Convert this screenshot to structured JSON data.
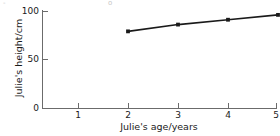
{
  "figure": {
    "background_color": "#ffffff",
    "axis_color": "#6b6b6b",
    "text_color": "#1a1a1a",
    "series_color": "#1a1a1a",
    "top_edge_artifacts": [
      "-",
      "o"
    ]
  },
  "chart_data": {
    "type": "line",
    "title": "",
    "subtitle": "",
    "xlabel": "Julie's age/years",
    "ylabel": "Julie's height/cm",
    "x": [
      2,
      3,
      4,
      5
    ],
    "values": [
      79,
      86,
      91,
      96
    ],
    "series": [
      {
        "name": "Julie's height",
        "x": [
          2,
          3,
          4,
          5
        ],
        "values": [
          79,
          86,
          91,
          96
        ]
      }
    ],
    "xlim": [
      0,
      5.4
    ],
    "ylim": [
      0,
      103
    ],
    "xticks": [
      1,
      2,
      3,
      4,
      5
    ],
    "xtick_labels": [
      "1",
      "2",
      "3",
      "4",
      "5"
    ],
    "yticks": [
      0,
      50,
      100
    ],
    "ytick_labels": [
      "0",
      "50",
      "100"
    ],
    "grid": false,
    "legend": false,
    "legend_position": "none",
    "marker": "square",
    "annotations": []
  }
}
